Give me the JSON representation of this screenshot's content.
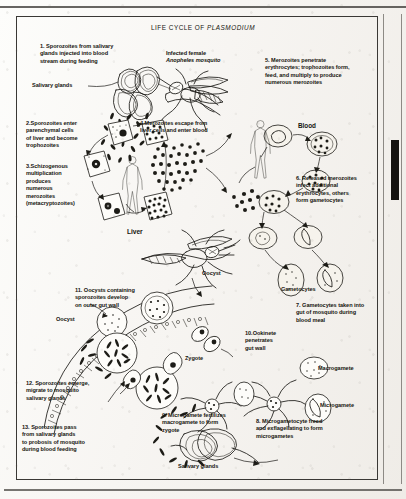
{
  "figure": {
    "title_prefix": "LIFE CYCLE OF ",
    "title_italic": "PLASMODIUM",
    "title_full": "LIFE CYCLE OF PLASMODIUM"
  },
  "steps": [
    {
      "number": "1.",
      "text": "Sporozoites from salivary\nglands injected into blood\nstream during feeding"
    },
    {
      "number": "2.",
      "text": "Sporozoites enter\nparenchymal cells\nof liver and become\ntrophozoites"
    },
    {
      "number": "3.",
      "text": "Schizogenous\nmultiplication\nproduces\nnumerous\nmerozoites\n(metacryptozoites)"
    },
    {
      "number": "4.",
      "text": "Merozoites escape from\nliver cells and enter blood"
    },
    {
      "number": "5.",
      "text": "Merozoites penetrate\nerythrocytes; trophozoites form,\nfeed, and multiply to produce\nnumerous merozoites"
    },
    {
      "number": "6.",
      "text": "Released merozoites\ninfect additional\nerythrocytes, others\nform gametocytes"
    },
    {
      "number": "7.",
      "text": "Gametocytes taken into\ngut of mosquito during\nblood meal"
    },
    {
      "number": "8.",
      "text": "Microgametocyte freed\nand exflagellating to form\nmicrogametes"
    },
    {
      "number": "9.",
      "text": "Microgamete fertilizes\nmacrogamete to form\nzygote"
    },
    {
      "number": "10.",
      "text": "Ookinete\npenetrates\ngut wall"
    },
    {
      "number": "11.",
      "text": "Oocysts containing\nsporozoites develop\non outer gut wall"
    },
    {
      "number": "12.",
      "text": "Sporozoites emerge,\nmigrate to mosquito\nsalivary glands"
    },
    {
      "number": "13.",
      "text": "Sporozoites pass\nfrom salivary glands\nto probosis of mosquito\nduring blood feeding"
    }
  ],
  "annotations": {
    "mosquito_top_line1": "Infected female",
    "mosquito_top_line2": "Anopheles mosquito",
    "salivary_glands_top": "Salivary glands",
    "salivary_glands_bottom": "Salivary glands",
    "liver": "Liver",
    "blood": "Blood",
    "gametocytes": "Gametocytes",
    "oocyst_label": "Oocyst",
    "oocyst_pointer": "Oocyst",
    "zygote": "Zygote",
    "macrogamete": "Macrogamete",
    "microgamete": "Microgamete"
  },
  "colors": {
    "ink": "#1a1915",
    "paper": "#fbfaf8",
    "frame": "#3a3835",
    "scan_bar": "#14120f"
  }
}
